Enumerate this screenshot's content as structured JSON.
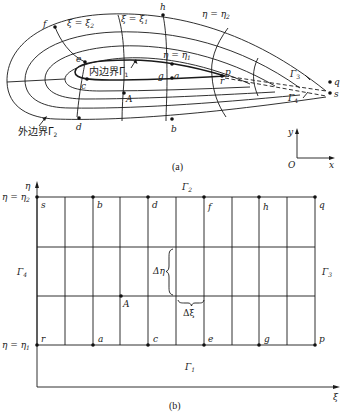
{
  "figure": {
    "subfigure_a": {
      "caption": "(a)",
      "title": "Physical domain C-grid around airfoil",
      "inner_boundary_label": "内边界Γ",
      "inner_boundary_sub": "1",
      "outer_boundary_label": "外边界Γ",
      "outer_boundary_sub": "2",
      "gamma3_label": "Γ",
      "gamma3_sub": "3",
      "gamma4_label": "Γ",
      "gamma4_sub": "4",
      "xi_line_left": "ξ = ξ",
      "xi_line_left_sub": "2",
      "xi_line_right": "ξ = ξ",
      "xi_line_right_sub": "1",
      "eta_outer": "η = η",
      "eta_outer_sub": "2",
      "eta_inner": "η = η",
      "eta_inner_sub": "1",
      "points": {
        "f": "f",
        "h": "h",
        "e": "e",
        "c": "c",
        "g": "g",
        "a": "a",
        "p": "p",
        "r": "r",
        "q": "q",
        "s": "s",
        "A": "A",
        "d": "d",
        "b": "b"
      },
      "axes": {
        "origin": "O",
        "x": "x",
        "y": "y"
      }
    },
    "subfigure_b": {
      "caption": "(b)",
      "title": "Computational domain (rectangular)",
      "axis_x": "ξ",
      "axis_y": "η",
      "eta_top": "η = η",
      "eta_top_sub": "2",
      "eta_bottom": "η = η",
      "eta_bottom_sub": "1",
      "boundaries": {
        "top": {
          "label": "Γ",
          "sub": "2"
        },
        "bottom": {
          "label": "Γ",
          "sub": "1"
        },
        "left": {
          "label": "Γ",
          "sub": "4"
        },
        "right": {
          "label": "Γ",
          "sub": "3"
        }
      },
      "top_points": [
        "s",
        "b",
        "d",
        "f",
        "h",
        "q"
      ],
      "bottom_points": [
        "r",
        "a",
        "c",
        "e",
        "g",
        "p"
      ],
      "interior_point": "A",
      "delta_eta": "Δη",
      "delta_xi": "Δξ",
      "grid": {
        "columns": 10,
        "rows": 3
      }
    }
  }
}
